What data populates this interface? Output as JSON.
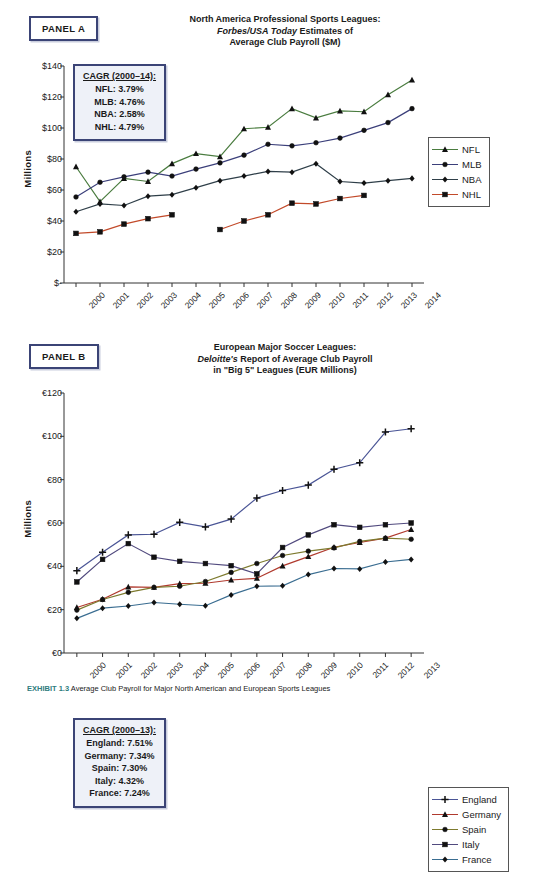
{
  "caption": {
    "exhibit": "EXHIBIT 1.3",
    "text": "Average Club Payroll for Major North American and European Sports Leagues"
  },
  "panel_a": {
    "tag": "PANEL A",
    "title_line1": "North America Professional Sports Leagues:",
    "title_line2_italic": "Forbes/USA Today",
    "title_line2_rest": " Estimates of",
    "title_line3": "Average Club Payroll ($M)",
    "axis_title": "Millions",
    "cagr_header": "CAGR (2000–14):",
    "cagr_rows": [
      "NFL: 3.79%",
      "MLB: 4.76%",
      "NBA: 2.58%",
      "NHL: 4.79%"
    ]
  },
  "panel_b": {
    "tag": "PANEL B",
    "title_line1": "European Major Soccer Leagues:",
    "title_line2_italic": "Deloitte's",
    "title_line2_rest": " Report of Average Club Payroll",
    "title_line3": "in \"Big 5\" Leagues (EUR Millions)",
    "axis_title": "Millions",
    "cagr_header": "CAGR (2000–13):",
    "cagr_rows": [
      "England: 7.51%",
      "Germany: 7.34%",
      "Spain: 7.30%",
      "Italy: 4.32%",
      "France: 7.24%"
    ]
  },
  "chart_data": [
    {
      "type": "line",
      "panel": "A",
      "title": "North America Professional Sports Leagues: Forbes/USA Today Estimates of Average Club Payroll ($M)",
      "xlabel": "",
      "ylabel": "Millions",
      "ylim": [
        0,
        140
      ],
      "yticks": [
        0,
        20,
        40,
        60,
        80,
        100,
        120,
        140
      ],
      "ytick_labels": [
        "$-",
        "$20",
        "$40",
        "$60",
        "$80",
        "$100",
        "$120",
        "$140"
      ],
      "grid": false,
      "legend_position": "right",
      "categories": [
        "2000",
        "2001",
        "2002",
        "2003",
        "2004",
        "2005",
        "2006",
        "2007",
        "2008",
        "2009",
        "2010",
        "2011",
        "2012",
        "2013",
        "2014"
      ],
      "series": [
        {
          "name": "NFL",
          "color": "#4a7c3f",
          "marker": "triangle",
          "values": [
            75.0,
            52.5,
            67.5,
            65.5,
            77.0,
            83.5,
            81.5,
            99.5,
            100.5,
            112.5,
            106.5,
            111.0,
            110.5,
            121.5,
            131.0
          ]
        },
        {
          "name": "MLB",
          "color": "#3b3f7a",
          "marker": "circle",
          "values": [
            55.5,
            65.0,
            68.5,
            71.5,
            69.0,
            73.5,
            77.5,
            82.5,
            89.5,
            88.5,
            90.5,
            93.5,
            98.5,
            103.5,
            112.5
          ]
        },
        {
          "name": "NBA",
          "color": "#2f3f49",
          "marker": "diamond",
          "values": [
            46.0,
            51.0,
            50.0,
            56.0,
            57.0,
            61.5,
            66.0,
            69.0,
            72.0,
            71.5,
            77.0,
            65.5,
            64.5,
            66.0,
            67.5
          ]
        },
        {
          "name": "NHL",
          "color": "#c24a2a",
          "marker": "square",
          "values": [
            32.0,
            33.0,
            38.0,
            41.5,
            44.0,
            null,
            34.5,
            40.0,
            44.0,
            51.5,
            51.0,
            54.5,
            56.5,
            null,
            null
          ]
        }
      ]
    },
    {
      "type": "line",
      "panel": "B",
      "title": "European Major Soccer Leagues: Deloitte's Report of Average Club Payroll in \"Big 5\" Leagues (EUR Millions)",
      "xlabel": "",
      "ylabel": "Millions",
      "ylim": [
        0,
        120
      ],
      "yticks": [
        0,
        20,
        40,
        60,
        80,
        100,
        120
      ],
      "ytick_labels": [
        "€0",
        "€20",
        "€40",
        "€60",
        "€80",
        "€100",
        "€120"
      ],
      "grid": false,
      "legend_position": "right",
      "categories": [
        "2000",
        "2001",
        "2002",
        "2003",
        "2004",
        "2005",
        "2006",
        "2007",
        "2008",
        "2009",
        "2010",
        "2011",
        "2012",
        "2013"
      ],
      "series": [
        {
          "name": "England",
          "color": "#4a5596",
          "marker": "plus",
          "values": [
            38.0,
            46.5,
            54.5,
            54.8,
            60.3,
            58.2,
            61.8,
            71.5,
            75.0,
            77.5,
            84.8,
            87.8,
            102.0,
            103.5
          ]
        },
        {
          "name": "Germany",
          "color": "#b03a2e",
          "marker": "triangle",
          "values": [
            21.0,
            24.8,
            30.5,
            30.3,
            32.0,
            32.2,
            33.7,
            34.5,
            40.2,
            44.5,
            48.8,
            51.0,
            53.0,
            57.0
          ]
        },
        {
          "name": "Spain",
          "color": "#7d7a2e",
          "marker": "circle",
          "values": [
            19.8,
            24.7,
            28.0,
            30.3,
            30.8,
            33.0,
            37.2,
            41.3,
            45.0,
            47.0,
            48.5,
            51.5,
            53.0,
            52.5
          ]
        },
        {
          "name": "Italy",
          "color": "#514a7e",
          "marker": "square",
          "values": [
            32.8,
            43.2,
            50.5,
            44.2,
            42.3,
            41.3,
            40.3,
            36.5,
            48.7,
            54.5,
            59.2,
            58.0,
            59.2,
            60.0
          ]
        },
        {
          "name": "France",
          "color": "#3a6d91",
          "marker": "diamond",
          "values": [
            16.0,
            20.7,
            21.7,
            23.3,
            22.5,
            21.8,
            26.8,
            30.8,
            31.0,
            36.2,
            39.0,
            38.8,
            42.0,
            43.2
          ]
        }
      ]
    }
  ]
}
